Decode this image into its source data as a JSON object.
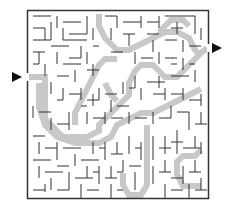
{
  "puzzle": {
    "type": "maze",
    "entry_arrow": {
      "side": "left",
      "glyph": "▶"
    },
    "exit_arrow": {
      "side": "right",
      "glyph": "▶"
    },
    "colors": {
      "wall": "#333333",
      "solution": "#c8c8c8",
      "background": "#ffffff",
      "arrow": "#111111"
    }
  }
}
